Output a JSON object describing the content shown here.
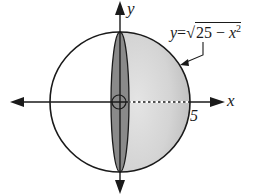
{
  "figure": {
    "type": "solid-of-revolution-diagram",
    "axes": {
      "x_label": "x",
      "y_label": "y"
    },
    "tick_labels": {
      "radius_tick": "5"
    },
    "curve_label": {
      "lhs": "y",
      "equals": "=",
      "radical_sign": "√",
      "radicand_prefix": "25 − ",
      "variable": "x",
      "exponent": "2"
    },
    "geometry": {
      "radius_value": 5,
      "circle_center_px": [
        120,
        102
      ],
      "circle_radius_px": 70,
      "disk_rx_px": 9
    },
    "colors": {
      "stroke": "#1a1a1a",
      "hemisphere_fill": "#cfcfcf",
      "hemisphere_fill_light": "#e2e2e2",
      "disk_fill": "#8a8a8a",
      "background": "#ffffff"
    }
  }
}
